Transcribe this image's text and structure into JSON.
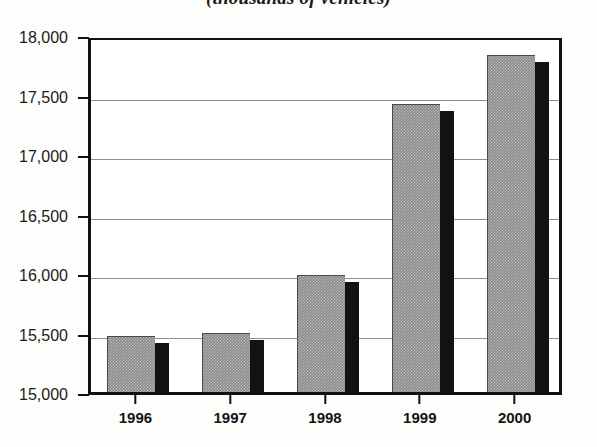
{
  "chart_data": {
    "type": "bar",
    "title": "(thousands of vehicles)",
    "xlabel": "",
    "ylabel": "",
    "categories": [
      "1996",
      "1997",
      "1998",
      "1999",
      "2000"
    ],
    "values": [
      15470,
      15500,
      15980,
      17420,
      17830
    ],
    "ylim": [
      15000,
      18000
    ],
    "ytick_labels": [
      "15,000",
      "15,500",
      "16,000",
      "16,500",
      "17,000",
      "17,500",
      "18,000"
    ],
    "ytick_values": [
      15000,
      15500,
      16000,
      16500,
      17000,
      17500,
      18000
    ],
    "grid": true,
    "legend": null,
    "series": [
      {
        "name": "Vehicles",
        "values": [
          15470,
          15500,
          15980,
          17420,
          17830
        ]
      }
    ],
    "colors": {
      "bar_fill": "#8a8a8a",
      "bar_shadow": "#121212",
      "axis": "#111111",
      "gridline": "#8e8e8e",
      "background": "#fdfdfb",
      "plot_background": "#ffffff",
      "text": "#1b1b1b"
    }
  }
}
